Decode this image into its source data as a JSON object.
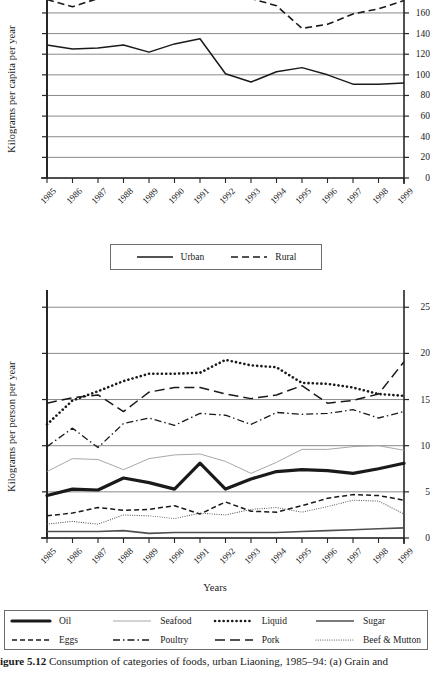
{
  "figure": {
    "caption_bold": "igure 5.12",
    "caption_text": "Consumption of categories of foods, urban Liaoning, 1985–94: (a) Grain and"
  },
  "chart_data": [
    {
      "id": "grain",
      "type": "line",
      "title": "",
      "xlabel": "",
      "ylabel": "Kilograms per capita per year",
      "categories": [
        "1985",
        "1986",
        "1987",
        "1988",
        "1989",
        "1990",
        "1991",
        "1992",
        "1993",
        "1994",
        "1995",
        "1996",
        "1997",
        "1998",
        "1999"
      ],
      "x": [
        1985,
        1986,
        1987,
        1988,
        1989,
        1990,
        1991,
        1992,
        1993,
        1994,
        1995,
        1996,
        1997,
        1998,
        1999
      ],
      "ylim": [
        0,
        190
      ],
      "yticks": [
        0,
        20,
        40,
        60,
        80,
        100,
        120,
        140,
        160,
        180
      ],
      "grid": true,
      "legend_position": "below",
      "series": [
        {
          "name": "Urban",
          "style": "solid",
          "values": [
            129,
            125,
            126,
            129,
            122,
            130,
            135,
            101,
            93,
            103,
            107,
            100,
            91,
            91,
            92
          ]
        },
        {
          "name": "Rural",
          "style": "dashed",
          "values": [
            173,
            166,
            174,
            182,
            186,
            179,
            178,
            183,
            174,
            167,
            145,
            149,
            159,
            164,
            172
          ]
        }
      ]
    },
    {
      "id": "categories",
      "type": "line",
      "title": "",
      "xlabel": "Years",
      "ylabel": "Kilograms per person per year",
      "categories": [
        "1985",
        "1986",
        "1987",
        "1988",
        "1989",
        "1990",
        "1991",
        "1992",
        "1993",
        "1994",
        "1995",
        "1996",
        "1997",
        "1998",
        "1999"
      ],
      "x": [
        1985,
        1986,
        1987,
        1988,
        1989,
        1990,
        1991,
        1992,
        1993,
        1994,
        1995,
        1996,
        1997,
        1998,
        1999
      ],
      "ylim": [
        0,
        26
      ],
      "yticks": [
        0,
        5,
        10,
        15,
        20,
        25
      ],
      "grid": true,
      "legend_position": "below",
      "series": [
        {
          "name": "Oil",
          "style": "thick-solid",
          "values": [
            4.6,
            5.3,
            5.2,
            6.5,
            6.0,
            5.3,
            8.1,
            5.3,
            6.4,
            7.2,
            7.4,
            7.3,
            7.0,
            7.5,
            8.1
          ]
        },
        {
          "name": "Eggs",
          "style": "dash-dash",
          "values": [
            2.4,
            2.7,
            3.3,
            3.0,
            3.1,
            3.5,
            2.6,
            3.9,
            2.9,
            2.8,
            3.5,
            4.3,
            4.7,
            4.6,
            4.1
          ]
        },
        {
          "name": "Seafood",
          "style": "thin-solid",
          "values": [
            7.2,
            8.6,
            8.5,
            7.4,
            8.6,
            9.0,
            9.1,
            8.3,
            7.0,
            8.2,
            9.6,
            9.6,
            9.9,
            10.0,
            9.5
          ]
        },
        {
          "name": "Poultry",
          "style": "dash-dot",
          "values": [
            9.9,
            11.9,
            9.8,
            12.4,
            13.0,
            12.2,
            13.5,
            13.3,
            12.3,
            13.6,
            13.4,
            13.5,
            13.9,
            13.0,
            13.7
          ]
        },
        {
          "name": "Liquid",
          "style": "dotted-thick",
          "values": [
            12.3,
            14.9,
            15.9,
            17.0,
            17.8,
            17.8,
            17.9,
            19.3,
            18.7,
            18.5,
            16.8,
            16.7,
            16.3,
            15.6,
            15.4
          ]
        },
        {
          "name": "Pork",
          "style": "long-dash",
          "values": [
            14.6,
            15.2,
            15.5,
            13.7,
            15.8,
            16.3,
            16.3,
            15.6,
            15.1,
            15.5,
            16.5,
            14.6,
            14.9,
            15.6,
            19.1
          ]
        },
        {
          "name": "Sugar",
          "style": "medium-solid",
          "values": [
            0.7,
            0.7,
            0.7,
            0.8,
            0.5,
            0.6,
            0.6,
            0.6,
            0.6,
            0.6,
            0.7,
            0.8,
            0.9,
            1.0,
            1.1
          ]
        },
        {
          "name": "Beef & Mutton",
          "style": "dotted-fine",
          "values": [
            1.5,
            1.8,
            1.5,
            2.5,
            2.4,
            2.1,
            2.7,
            2.5,
            3.1,
            3.3,
            2.8,
            3.4,
            4.1,
            4.0,
            2.6
          ]
        }
      ]
    }
  ],
  "top_chart": {
    "ylabel": "Kilograms per capita per year",
    "yticks": [
      "180",
      "160",
      "140",
      "120",
      "100",
      "80",
      "60",
      "40",
      "20",
      "0"
    ],
    "xticks": [
      "1985",
      "1986",
      "1987",
      "1988",
      "1989",
      "1990",
      "1991",
      "1992",
      "1993",
      "1994",
      "1995",
      "1996",
      "1997",
      "1998",
      "1999"
    ],
    "legend": {
      "items": [
        {
          "label": "Urban",
          "style": "solid"
        },
        {
          "label": "Rural",
          "style": "dashed"
        }
      ]
    }
  },
  "bottom_chart": {
    "ylabel": "Kilograms per person per year",
    "xlabel": "Years",
    "yticks": [
      "25",
      "20",
      "15",
      "10",
      "5",
      "0"
    ],
    "xticks": [
      "1985",
      "1986",
      "1987",
      "1988",
      "1989",
      "1990",
      "1991",
      "1992",
      "1993",
      "1994",
      "1995",
      "1996",
      "1997",
      "1998",
      "1999"
    ],
    "legend": {
      "items": [
        {
          "label": "Oil",
          "style": "thick-solid"
        },
        {
          "label": "Seafood",
          "style": "thin-solid"
        },
        {
          "label": "Liquid",
          "style": "dotted-thick"
        },
        {
          "label": "Sugar",
          "style": "medium-solid"
        },
        {
          "label": "Eggs",
          "style": "dash-dash"
        },
        {
          "label": "Poultry",
          "style": "dash-dot"
        },
        {
          "label": "Pork",
          "style": "long-dash"
        },
        {
          "label": "Beef & Mutton",
          "style": "dotted-fine"
        }
      ]
    }
  },
  "colors": {
    "ink": "#1a1a1a",
    "grid": "#8a8a8a",
    "axis": "#262626",
    "light": "#b4b4b4"
  }
}
